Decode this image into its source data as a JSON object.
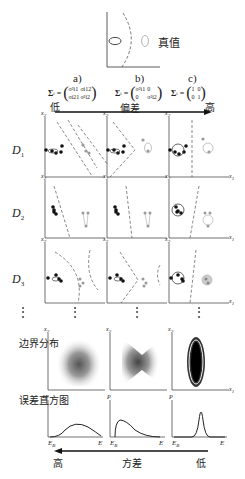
{
  "legend": {
    "label": "真值",
    "dark_ellipse": "estimate",
    "gray_ellipse": "true value"
  },
  "columns": [
    {
      "id": "a",
      "label": "a)",
      "sigma_label": "Σ",
      "sigma_sub": "i",
      "matrix": [
        [
          "σ²i1",
          "σi12"
        ],
        [
          "σi21",
          "σ²i2"
        ]
      ]
    },
    {
      "id": "b",
      "label": "b)",
      "sigma_label": "Σ",
      "sigma_sub": "i",
      "matrix": [
        [
          "σ²i1",
          "0"
        ],
        [
          "0",
          "σ²i2"
        ]
      ]
    },
    {
      "id": "c",
      "label": "c)",
      "sigma_label": "Σ",
      "sigma_sub": "i",
      "matrix": [
        [
          "1",
          "0"
        ],
        [
          "0",
          "1"
        ]
      ]
    }
  ],
  "top_arrow": {
    "left": "低",
    "middle": "偏差",
    "right": "高"
  },
  "rows": [
    {
      "label": "D",
      "sub": "1"
    },
    {
      "label": "D",
      "sub": "2"
    },
    {
      "label": "D",
      "sub": "3"
    }
  ],
  "axis": {
    "x": "x",
    "x_sub": "1",
    "y": "x",
    "y_sub": "2"
  },
  "ellipsis": "⋮",
  "boundary_row": {
    "label": "边界分布"
  },
  "histogram_row": {
    "label": "误差直方图",
    "y_axis": "P",
    "x_start": "E",
    "x_start_sub": "B",
    "x_end": "E"
  },
  "bottom_arrow": {
    "left": "高",
    "middle": "方差",
    "right": "低"
  },
  "colors": {
    "ink": "#222222",
    "gray": "#9a9a9a",
    "dash": "#555555"
  }
}
